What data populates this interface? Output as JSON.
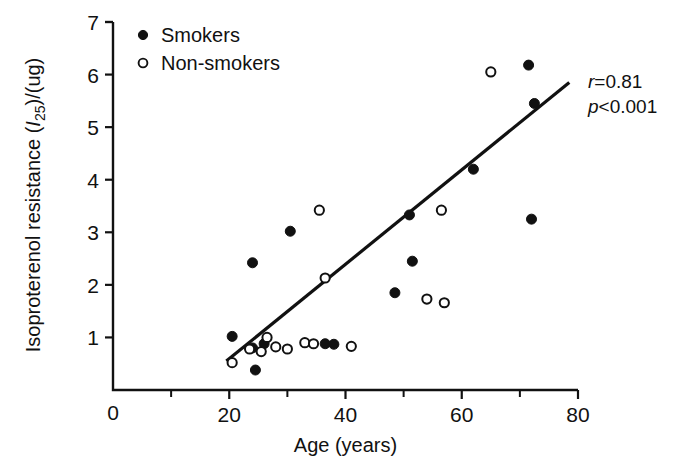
{
  "figure": {
    "background_color": "#ffffff",
    "ink_color": "#111111"
  },
  "axes": {
    "x": {
      "title": "Age (years)",
      "ticks": [
        0,
        20,
        40,
        60,
        80
      ],
      "tick_labels": [
        "0",
        "20",
        "40",
        "60",
        "80"
      ],
      "minor_ticks": [
        10,
        30,
        50,
        70
      ],
      "min": 0,
      "max": 80
    },
    "y": {
      "title_main": "Isoproterenol resistance (",
      "title_italic": "I",
      "title_sub": "25",
      "title_tail": ")/(ug)",
      "title_full": "Isoproterenol resistance (I25)/(ug)",
      "ticks": [
        1,
        2,
        3,
        4,
        5,
        6,
        7
      ],
      "tick_labels": [
        "1",
        "2",
        "3",
        "4",
        "5",
        "6",
        "7"
      ],
      "min": 0,
      "max": 7
    }
  },
  "legend": {
    "entries": [
      {
        "label": "Smokers",
        "marker": "filled-circle"
      },
      {
        "label": "Non-smokers",
        "marker": "open-circle"
      }
    ]
  },
  "annotations": {
    "r_label": "r",
    "r_value": "=0.81",
    "p_label": "p",
    "p_value": "<0.001"
  },
  "chart_data": {
    "type": "scatter",
    "title": "",
    "xlabel": "Age (years)",
    "ylabel": "Isoproterenol resistance (I25)/(ug)",
    "xlim": [
      0,
      80
    ],
    "ylim": [
      0,
      7
    ],
    "grid": false,
    "legend_position": "top-left",
    "statistics": {
      "r": 0.81,
      "p": "<0.001"
    },
    "fit_line": {
      "name": "regression line",
      "x_start": 19.5,
      "y_start": 0.55,
      "x_end": 78.5,
      "y_end": 5.85
    },
    "series": [
      {
        "name": "Smokers",
        "marker": "filled-circle",
        "points": [
          [
            20.5,
            1.02
          ],
          [
            24.0,
            0.8
          ],
          [
            24.5,
            0.38
          ],
          [
            24.0,
            2.42
          ],
          [
            26.0,
            0.88
          ],
          [
            30.5,
            3.02
          ],
          [
            36.5,
            0.88
          ],
          [
            38.0,
            0.87
          ],
          [
            48.5,
            1.85
          ],
          [
            51.0,
            3.33
          ],
          [
            51.5,
            2.45
          ],
          [
            62.0,
            4.2
          ],
          [
            71.5,
            6.18
          ],
          [
            72.5,
            5.45
          ],
          [
            72.0,
            3.25
          ]
        ]
      },
      {
        "name": "Non-smokers",
        "marker": "open-circle",
        "points": [
          [
            20.5,
            0.52
          ],
          [
            23.5,
            0.78
          ],
          [
            25.5,
            0.73
          ],
          [
            26.5,
            1.0
          ],
          [
            28.0,
            0.82
          ],
          [
            30.0,
            0.78
          ],
          [
            33.0,
            0.9
          ],
          [
            34.5,
            0.88
          ],
          [
            35.5,
            3.42
          ],
          [
            36.5,
            2.13
          ],
          [
            41.0,
            0.83
          ],
          [
            54.0,
            1.73
          ],
          [
            57.0,
            1.66
          ],
          [
            56.5,
            3.42
          ],
          [
            65.0,
            6.05
          ]
        ]
      }
    ]
  }
}
